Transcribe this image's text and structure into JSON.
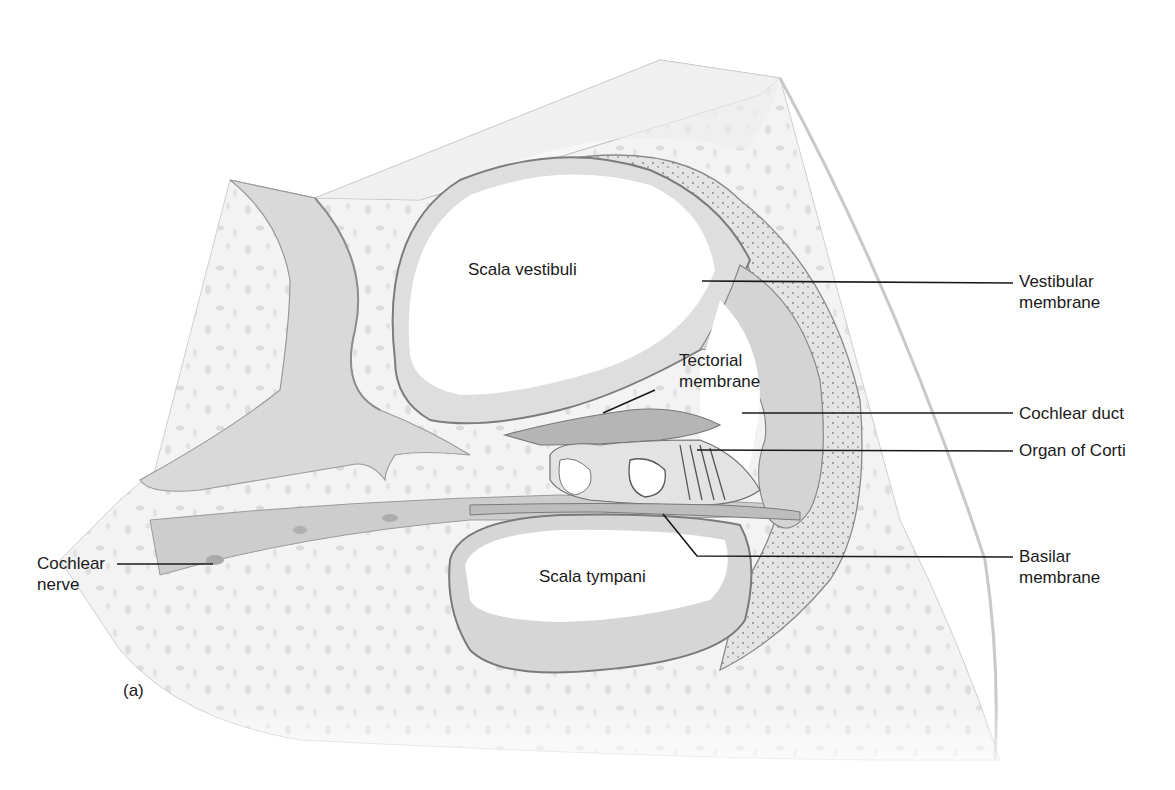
{
  "figure": {
    "panel_label": "(a)",
    "colors": {
      "background": "#ffffff",
      "bone": "#f2f2f2",
      "bone_speckle": "#dcdcdc",
      "tissue": "#d6d6d6",
      "tissue_dark": "#a8a8a8",
      "outline": "#8a8a8a",
      "leader_line": "#1a1a1a",
      "text": "#1a1a1a"
    }
  },
  "labels": {
    "scala_vestibuli": "Scala vestibuli",
    "scala_tympani": "Scala tympani",
    "tectorial_membrane": {
      "line1": "Tectorial",
      "line2": "membrane"
    },
    "vestibular_membrane": {
      "line1": "Vestibular",
      "line2": "membrane"
    },
    "cochlear_duct": "Cochlear duct",
    "organ_of_corti": "Organ of Corti",
    "basilar_membrane": {
      "line1": "Basilar",
      "line2": "membrane"
    },
    "cochlear_nerve": {
      "line1": "Cochlear",
      "line2": "nerve"
    }
  }
}
